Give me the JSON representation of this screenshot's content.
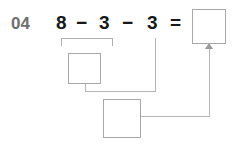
{
  "worksheet": {
    "problem_number": "04",
    "equation": {
      "operand_1": "8",
      "operator_1": "−",
      "operand_2": "3",
      "operator_2": "−",
      "operand_3": "3",
      "equals": "="
    },
    "boxes": {
      "answer": "",
      "step_1": "",
      "step_2": ""
    },
    "colors": {
      "problem_number": "#6e6e6e",
      "equation_text": "#17181a",
      "box_border": "#a8a8a8",
      "connector_line": "#b5b5b5",
      "arrow": "#9a9a9a",
      "background": "#ffffff"
    }
  }
}
